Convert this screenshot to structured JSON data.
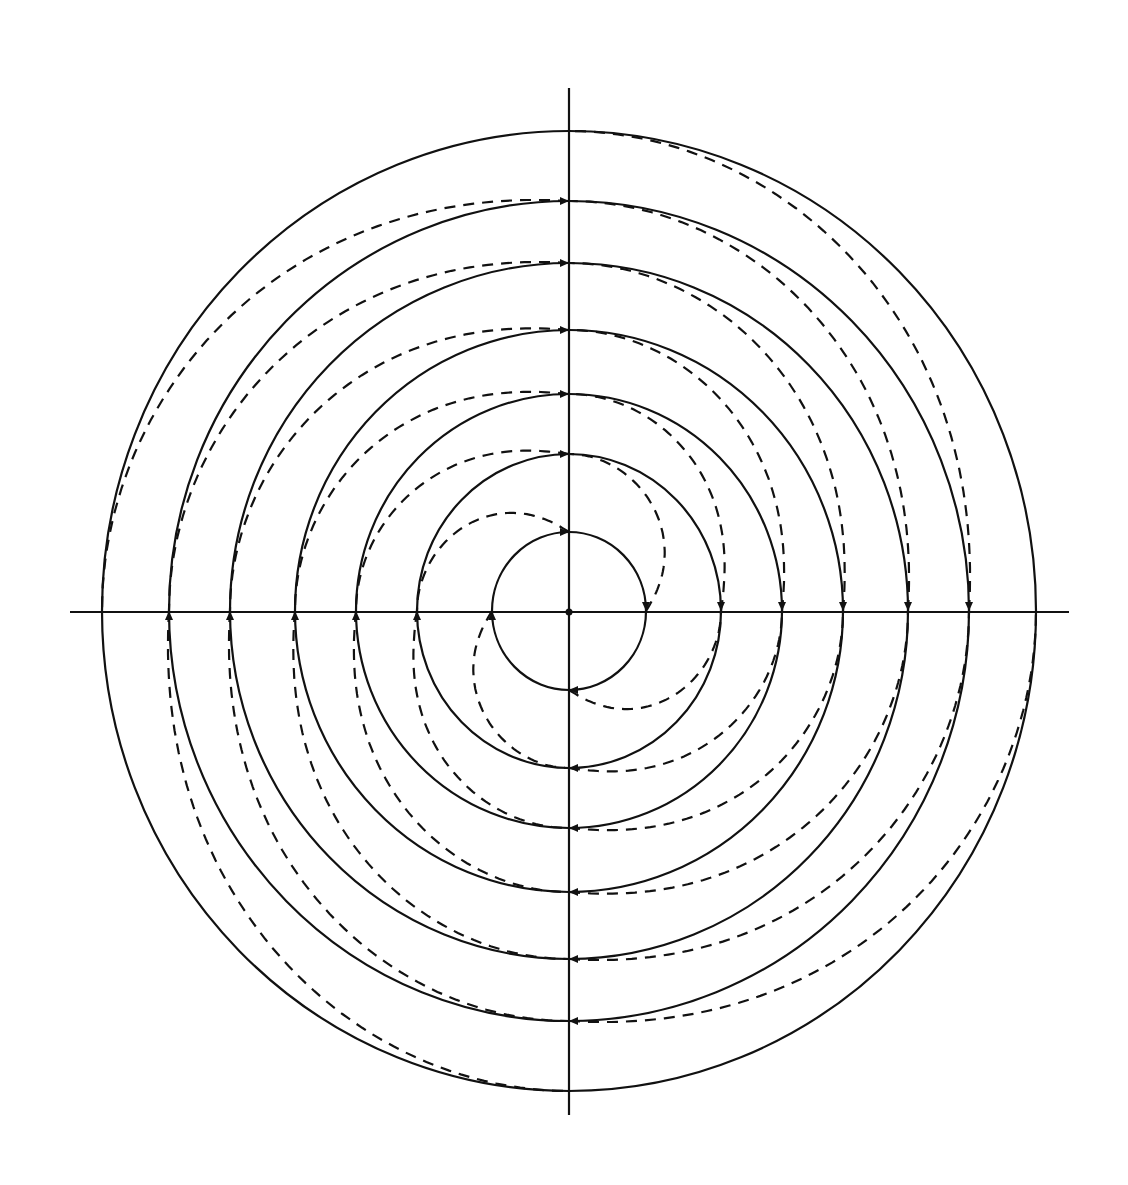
{
  "figure": {
    "width": 1128,
    "height": 1185,
    "background": "#ffffff",
    "ink": "#111111",
    "center": {
      "x": 569,
      "y": 611
    },
    "axes": {
      "horizontal": {
        "x1": 70,
        "x2": 1069,
        "y": 612
      },
      "vertical": {
        "x": 569,
        "y1": 88,
        "y2": 1115
      }
    },
    "rings": [
      {
        "id": 1,
        "rx": 77,
        "ry": 79
      },
      {
        "id": 2,
        "rx": 152,
        "ry": 157
      },
      {
        "id": 3,
        "rx": 213,
        "ry": 217
      },
      {
        "id": 4,
        "rx": 274,
        "ry": 281
      },
      {
        "id": 5,
        "rx": 339,
        "ry": 348
      },
      {
        "id": 6,
        "rx": 400,
        "ry": 410
      },
      {
        "id": 7,
        "rx": 467,
        "ry": 480
      }
    ],
    "spiral_quadrants": [
      {
        "name": "top-left",
        "start_angle_deg": -90,
        "end_angle_deg": -180
      },
      {
        "name": "bottom-left",
        "start_angle_deg": 180,
        "end_angle_deg": 90
      },
      {
        "name": "bottom-right",
        "start_angle_deg": 90,
        "end_angle_deg": 0
      },
      {
        "name": "top-right",
        "start_angle_deg": 0,
        "end_angle_deg": -90
      }
    ],
    "legend": {
      "solid_line": "concentric circles (7 rings)",
      "dashed_line": "quarter-arc spiral paths connecting ring k to ring k+1"
    }
  }
}
